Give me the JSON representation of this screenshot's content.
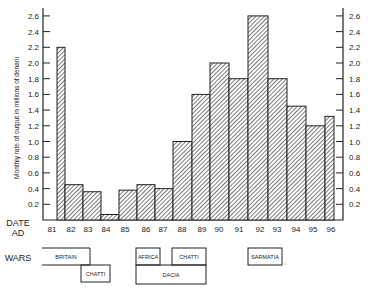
{
  "chart_data": {
    "type": "bar",
    "title": "",
    "xlabel": "DATE AD",
    "ylabel": "Monthly rate of output in millions of denarii",
    "ylim": [
      0,
      2.6
    ],
    "y_ticks": [
      "0.2",
      "0.4",
      "0.6",
      "0.8",
      "1.0",
      "1.2",
      "1.4",
      "1.6",
      "1.8",
      "2.0",
      "2.2",
      "2.4",
      "2.6"
    ],
    "grid": false,
    "legend": null,
    "x_tick_labels": [
      "81",
      "82",
      "83",
      "84",
      "85",
      "86",
      "87",
      "88",
      "89",
      "90",
      "91",
      "92",
      "93",
      "94",
      "95",
      "96"
    ],
    "categories": [
      "81",
      "82",
      "83",
      "84",
      "85",
      "86",
      "87",
      "88",
      "89",
      "90",
      "91",
      "92",
      "93",
      "94",
      "95",
      "96"
    ],
    "values": [
      2.2,
      0.45,
      0.36,
      0.07,
      0.38,
      0.45,
      0.4,
      1.0,
      1.6,
      2.0,
      1.8,
      2.6,
      1.8,
      1.45,
      1.2,
      1.32
    ],
    "bar_pixel_edges": [
      [
        57,
        65
      ],
      [
        65,
        83
      ],
      [
        83,
        101
      ],
      [
        101,
        119
      ],
      [
        119,
        137
      ],
      [
        137,
        155
      ],
      [
        155,
        173
      ],
      [
        173,
        192
      ],
      [
        192,
        210
      ],
      [
        210,
        229
      ],
      [
        229,
        248
      ],
      [
        248,
        268
      ],
      [
        268,
        287
      ],
      [
        287,
        306
      ],
      [
        306,
        325
      ],
      [
        325,
        334
      ]
    ],
    "date_row_label": [
      "DATE",
      "AD"
    ],
    "wars_row_label": "WARS",
    "wars": [
      {
        "name": "BRITAIN",
        "x1": 42,
        "x2": 90,
        "row": 0,
        "open_left": true
      },
      {
        "name": "CHATTI",
        "x1": 81,
        "x2": 110,
        "row": 1
      },
      {
        "name": "AFRICA",
        "x1": 136,
        "x2": 160,
        "row": 0
      },
      {
        "name": "CHATTI",
        "x1": 172,
        "x2": 206,
        "row": 0
      },
      {
        "name": "DACIA",
        "x1": 136,
        "x2": 206,
        "row": 1
      },
      {
        "name": "SARMATIA",
        "x1": 248,
        "x2": 282,
        "row": 0
      }
    ]
  },
  "colors": {
    "ink": "#222222",
    "background": "#ffffff"
  }
}
